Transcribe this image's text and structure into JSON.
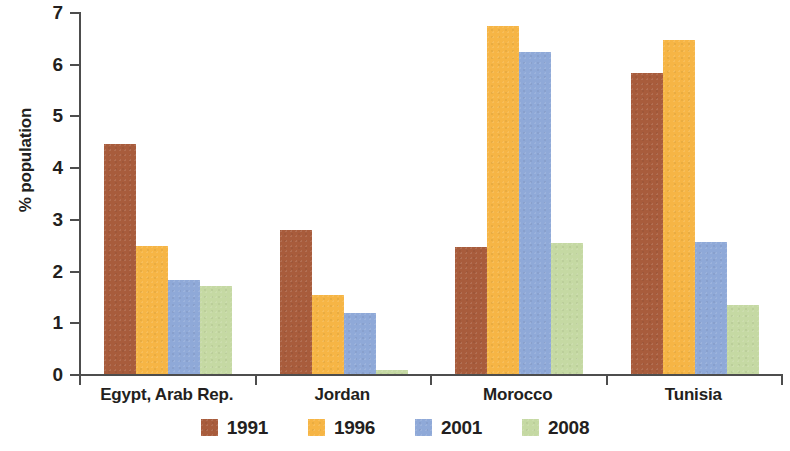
{
  "chart_data": {
    "type": "bar",
    "title": "",
    "subtitle": "",
    "xlabel": "",
    "ylabel": "% population",
    "ylim": [
      0,
      7
    ],
    "ytick_labels": [
      "0",
      "1",
      "2",
      "3",
      "4",
      "5",
      "6",
      "7"
    ],
    "ytick_values": [
      0,
      1,
      2,
      3,
      4,
      5,
      6,
      7
    ],
    "grid": false,
    "legend_position": "bottom",
    "categories": [
      "Egypt, Arab Rep.",
      "Jordan",
      "Morocco",
      "Tunisia"
    ],
    "series": [
      {
        "name": "1991",
        "color": "#a85c3c",
        "values": [
          4.45,
          2.78,
          2.45,
          5.83
        ]
      },
      {
        "name": "1996",
        "color": "#f6b545",
        "values": [
          2.48,
          1.52,
          6.73,
          6.45
        ]
      },
      {
        "name": "2001",
        "color": "#8fa9d8",
        "values": [
          1.82,
          1.18,
          6.22,
          2.55
        ]
      },
      {
        "name": "2008",
        "color": "#c5d9a3",
        "values": [
          1.7,
          0.07,
          2.53,
          1.33
        ]
      }
    ]
  },
  "axis": {
    "line_color": "#4d4d4d"
  }
}
